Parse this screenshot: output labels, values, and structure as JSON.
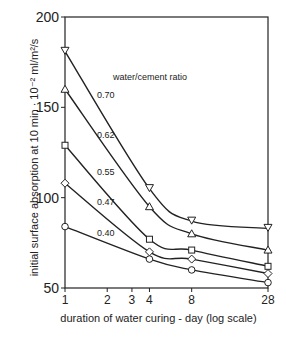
{
  "chart_data": {
    "type": "line",
    "title": "",
    "xlabel": "duration of water curing - day (log scale)",
    "ylabel": "initial surface absorption at 10 min · 10⁻² ml/m²/s",
    "xscale": "log",
    "xlim": [
      1,
      28
    ],
    "ylim": [
      50,
      200
    ],
    "x_ticks": [
      1,
      2,
      3,
      4,
      8,
      28
    ],
    "y_ticks": [
      50,
      100,
      150,
      200
    ],
    "legend_title": "water/cement ratio",
    "x": [
      1,
      4,
      8,
      28
    ],
    "series": [
      {
        "name": "0.70",
        "marker": "triangle-down",
        "values": [
          181,
          105,
          87,
          83
        ]
      },
      {
        "name": "0.62",
        "marker": "triangle-up",
        "values": [
          160,
          95,
          80,
          71
        ]
      },
      {
        "name": "0.55",
        "marker": "square",
        "values": [
          129,
          77,
          71,
          62
        ]
      },
      {
        "name": "0.47",
        "marker": "diamond",
        "values": [
          108,
          70,
          66,
          58
        ]
      },
      {
        "name": "0.40",
        "marker": "circle",
        "values": [
          84,
          66,
          60,
          53
        ]
      }
    ],
    "grid": false
  }
}
